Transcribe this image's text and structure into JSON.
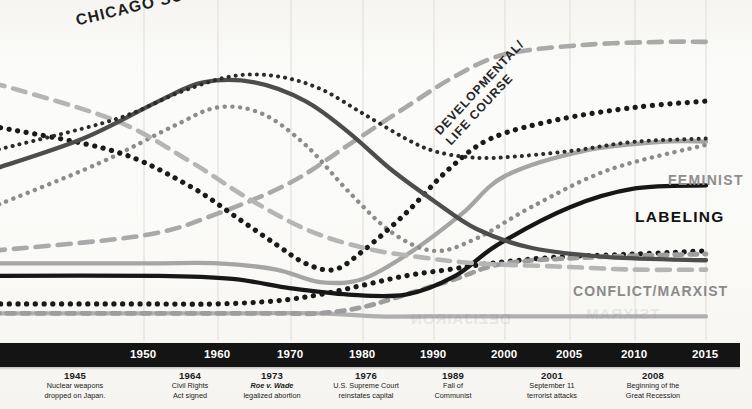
{
  "chart_data": {
    "type": "line",
    "title": "",
    "xlabel": "",
    "ylabel": "",
    "xlim": [
      1940,
      2015
    ],
    "grid": true,
    "legend_position": "inline-labels",
    "axis_years": [
      "1950",
      "1960",
      "1970",
      "1980",
      "1990",
      "2000",
      "2005",
      "2010",
      "2015"
    ],
    "series": [
      {
        "name": "CHICAGO SCHOOL",
        "style": "fine-dotted",
        "color": "#2b2b2b",
        "label_visible": true,
        "x": [
          1940,
          1948,
          1955,
          1962,
          1968,
          1974,
          1980,
          1986,
          1990,
          1995,
          2000,
          2005,
          2010,
          2015
        ],
        "values": [
          58,
          68,
          77,
          82,
          82,
          78,
          70,
          62,
          58,
          56,
          56,
          58,
          61,
          62
        ]
      },
      {
        "name": "UNLABELED-DARKGRAY-ARCH",
        "style": "solid-thick",
        "color": "#4d4d4d",
        "label_visible": false,
        "x": [
          1940,
          1946,
          1952,
          1958,
          1965,
          1972,
          1978,
          1984,
          1990,
          1996,
          2002,
          2008,
          2015
        ],
        "values": [
          52,
          62,
          74,
          80,
          80,
          74,
          64,
          52,
          42,
          33,
          27,
          24,
          23
        ]
      },
      {
        "name": "UNLABELED-MIDGRAY-DASH-DESCEND",
        "style": "long-dash",
        "color": "#b5b5b5",
        "label_visible": false,
        "x": [
          1940,
          1948,
          1956,
          1964,
          1972,
          1980,
          1988,
          1996,
          2004,
          2010,
          2015
        ],
        "values": [
          80,
          68,
          55,
          43,
          33,
          27,
          24,
          22,
          21,
          20,
          20
        ]
      },
      {
        "name": "UNLABELED-GRAY-DOTTED-ARCH",
        "style": "dotted",
        "color": "#8c8c8c",
        "label_visible": false,
        "x": [
          1940,
          1947,
          1954,
          1960,
          1966,
          1972,
          1978,
          1984,
          1990,
          1996,
          2002,
          2008,
          2015
        ],
        "values": [
          40,
          54,
          66,
          72,
          70,
          60,
          45,
          32,
          26,
          30,
          40,
          52,
          60
        ]
      },
      {
        "name": "UNLABELED-BLACK-DOTTED-SPIKE",
        "style": "bold-dotted",
        "color": "#1a1a1a",
        "label_visible": false,
        "x": [
          1940,
          1948,
          1956,
          1963,
          1968,
          1972,
          1976,
          1980,
          1986,
          1992,
          1998,
          2004,
          2010,
          2015
        ],
        "values": [
          66,
          58,
          47,
          36,
          28,
          22,
          20,
          26,
          38,
          52,
          62,
          68,
          72,
          74
        ]
      },
      {
        "name": "DEVELOPMENTAL/LIFE COURSE",
        "style": "long-dash",
        "color": "#a9a9a9",
        "label_visible": true,
        "x": [
          1940,
          1950,
          1960,
          1970,
          1978,
          1986,
          1993,
          2000,
          2006,
          2012,
          2015
        ],
        "values": [
          26,
          31,
          38,
          48,
          60,
          72,
          82,
          89,
          92,
          93,
          93
        ]
      },
      {
        "name": "UNLABELED-BLACK-SOLID-PEAK",
        "style": "solid-thick",
        "color": "#232323",
        "label_visible": false,
        "x": [
          1940,
          1950,
          1958,
          1963,
          1967,
          1971,
          1974,
          1977,
          1982,
          1988,
          1995,
          2002,
          2008,
          2015
        ],
        "values": [
          24,
          26,
          38,
          58,
          66,
          64,
          44,
          22,
          18,
          20,
          26,
          34,
          40,
          42
        ]
      },
      {
        "name": "FEMINIST",
        "style": "solid-thick",
        "color": "#a5a5a5",
        "label_visible": true,
        "x": [
          1940,
          1950,
          1960,
          1968,
          1974,
          1980,
          1987,
          1994,
          2000,
          2006,
          2012,
          2015
        ],
        "values": [
          22,
          22,
          22,
          20,
          16,
          17,
          26,
          38,
          50,
          58,
          61,
          61
        ]
      },
      {
        "name": "LABELING",
        "style": "solid-thick",
        "color": "#171717",
        "label_visible": true,
        "x": [
          1940,
          1952,
          1962,
          1970,
          1978,
          1986,
          1993,
          1999,
          2005,
          2010,
          2015
        ],
        "values": [
          18,
          18,
          17,
          14,
          12,
          12,
          18,
          28,
          40,
          46,
          47
        ]
      },
      {
        "name": "CONFLICT/MARXIST",
        "style": "short-dash",
        "color": "#9d9d9d",
        "label_visible": true,
        "x": [
          1940,
          1950,
          1960,
          1968,
          1974,
          1980,
          1986,
          1993,
          2000,
          2007,
          2015
        ],
        "values": [
          6,
          6,
          6,
          6,
          6,
          8,
          12,
          17,
          22,
          24,
          25
        ]
      },
      {
        "name": "UNLABELED-BLACK-DOTTED-BASELINE",
        "style": "bold-dotted",
        "color": "#1a1a1a",
        "label_visible": false,
        "x": [
          1940,
          1950,
          1960,
          1968,
          1974,
          1980,
          1986,
          1992,
          1998,
          2004,
          2010,
          2015
        ],
        "values": [
          9,
          9,
          9,
          10,
          12,
          15,
          18,
          20,
          22,
          24,
          25,
          26
        ]
      },
      {
        "name": "UNLABELED-GRAY-BASELINE",
        "style": "solid-thick",
        "color": "#b0b0b0",
        "label_visible": false,
        "x": [
          1940,
          1952,
          1964,
          1974,
          1982,
          1990,
          2000,
          2010,
          2015
        ],
        "values": [
          6,
          6,
          6,
          6,
          5,
          5,
          5,
          5,
          5
        ]
      }
    ]
  },
  "labels": {
    "chicago_school": "CHICAGO SCHOOL",
    "developmental_line1": "DEVELOPMENTAL/",
    "developmental_line2": "LIFE COURSE",
    "feminist": "FEMINIST",
    "labeling": "LABELING",
    "conflict_marxist": "CONFLICT/MARXIST"
  },
  "axis": {
    "ticks": [
      {
        "year": "1950",
        "x": 144
      },
      {
        "year": "1960",
        "x": 218
      },
      {
        "year": "1970",
        "x": 291
      },
      {
        "year": "1980",
        "x": 363
      },
      {
        "year": "1990",
        "x": 434
      },
      {
        "year": "2000",
        "x": 505
      },
      {
        "year": "2005",
        "x": 570
      },
      {
        "year": "2010",
        "x": 635
      },
      {
        "year": "2015",
        "x": 706
      }
    ]
  },
  "events": [
    {
      "year": "1945",
      "lines": [
        "Nuclear weapons",
        "dropped on Japan."
      ],
      "italic_first": false,
      "x": 75
    },
    {
      "year": "1964",
      "lines": [
        "Civil Rights",
        "Act signed"
      ],
      "italic_first": false,
      "x": 190
    },
    {
      "year": "1973",
      "lines": [
        "Roe v. Wade",
        "legalized abortion"
      ],
      "italic_first": true,
      "x": 272
    },
    {
      "year": "1976",
      "lines": [
        "U.S. Supreme Court",
        "reinstates capital"
      ],
      "italic_first": false,
      "x": 366
    },
    {
      "year": "1989",
      "lines": [
        "Fall of",
        "Communist"
      ],
      "italic_first": false,
      "x": 453
    },
    {
      "year": "2001",
      "lines": [
        "September 11",
        "terrorist attacks"
      ],
      "italic_first": false,
      "x": 552
    },
    {
      "year": "2008",
      "lines": [
        "Beginning of the",
        "Great Recession"
      ],
      "italic_first": false,
      "x": 653
    }
  ]
}
